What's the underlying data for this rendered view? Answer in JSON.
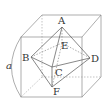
{
  "diagram": {
    "type": "cube with inscribed octahedron",
    "colors": {
      "line": "#8a8a8a",
      "octahedron": "#555555",
      "text": "#333333"
    },
    "dimension_label": "a",
    "vertex_labels": {
      "A": "A",
      "B": "B",
      "C": "C",
      "D": "D",
      "E": "E",
      "F": "F"
    },
    "cube": {
      "front_top_left": [
        21,
        37
      ],
      "front_top_right": [
        82,
        37
      ],
      "front_bottom_left": [
        21,
        97
      ],
      "front_bottom_right": [
        82,
        97
      ],
      "back_top_left": [
        42,
        15
      ],
      "back_top_right": [
        101,
        15
      ],
      "back_bottom_left": [
        42,
        77
      ],
      "back_bottom_right": [
        101,
        77
      ]
    },
    "octahedron": {
      "A": [
        62,
        27
      ],
      "B": [
        31,
        57
      ],
      "C": [
        52,
        67
      ],
      "D": [
        90,
        58
      ],
      "E": [
        62,
        43
      ],
      "F": [
        52,
        87
      ]
    }
  }
}
